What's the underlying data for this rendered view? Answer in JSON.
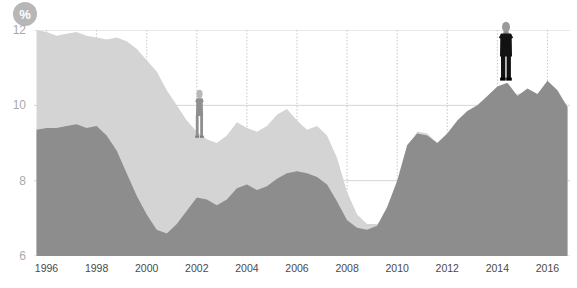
{
  "badge": {
    "icon": "percent-icon",
    "label": "%"
  },
  "chart_data": {
    "type": "area",
    "title": "",
    "subtitle": "",
    "xlabel": "",
    "ylabel": "%",
    "unit": "%",
    "grid": "vertical dotted at each labelled year; faint horizontal at each y tick",
    "legend_position": "none",
    "xlim": [
      1995.5,
      2016.9
    ],
    "ylim": [
      6,
      12
    ],
    "yticks": [
      6,
      8,
      10,
      12
    ],
    "ytick_labels": [
      "6",
      "8",
      "10",
      "12"
    ],
    "xticks": [
      1996,
      1998,
      2000,
      2002,
      2004,
      2006,
      2008,
      2010,
      2012,
      2014,
      2016
    ],
    "xtick_labels": [
      "1996",
      "1998",
      "2000",
      "2002",
      "2004",
      "2006",
      "2008",
      "2010",
      "2012",
      "2014",
      "2016"
    ],
    "colors": {
      "series_light": "#d4d4d4",
      "series_dark": "#8d8d8d",
      "grid": "#bdbdbd",
      "axis_text": "#4a4a4a",
      "y_text": "#a9a9a9"
    },
    "x": [
      1995.6,
      1996.0,
      1996.4,
      1996.8,
      1997.2,
      1997.6,
      1998.0,
      1998.4,
      1998.8,
      1999.2,
      1999.6,
      2000.0,
      2000.4,
      2000.8,
      2001.2,
      2001.6,
      2002.0,
      2002.4,
      2002.8,
      2003.2,
      2003.6,
      2004.0,
      2004.4,
      2004.8,
      2005.2,
      2005.6,
      2006.0,
      2006.4,
      2006.8,
      2007.2,
      2007.6,
      2008.0,
      2008.4,
      2008.8,
      2009.2,
      2009.6,
      2010.0,
      2010.4,
      2010.8,
      2011.2,
      2011.6,
      2012.0,
      2012.4,
      2012.8,
      2013.2,
      2013.6,
      2014.0,
      2014.4,
      2014.8,
      2015.2,
      2015.6,
      2016.0,
      2016.4,
      2016.8
    ],
    "series": [
      {
        "name": "light-area",
        "color": "#d4d4d4",
        "values": [
          12.0,
          11.95,
          11.85,
          11.9,
          11.95,
          11.85,
          11.8,
          11.75,
          11.8,
          11.7,
          11.5,
          11.2,
          10.9,
          10.4,
          10.0,
          9.6,
          9.3,
          9.1,
          9.0,
          9.2,
          9.55,
          9.4,
          9.3,
          9.45,
          9.75,
          9.9,
          9.6,
          9.35,
          9.45,
          9.2,
          8.6,
          7.7,
          7.1,
          6.85,
          6.85,
          7.1,
          7.6,
          8.9,
          9.3,
          9.25,
          9.0,
          9.2,
          9.55,
          9.8,
          9.95,
          10.15,
          10.35,
          10.4,
          10.3,
          10.35,
          10.3,
          10.55,
          10.3,
          10.0
        ]
      },
      {
        "name": "dark-area",
        "color": "#8d8d8d",
        "values": [
          9.35,
          9.4,
          9.4,
          9.45,
          9.5,
          9.4,
          9.45,
          9.2,
          8.8,
          8.2,
          7.6,
          7.1,
          6.7,
          6.6,
          6.85,
          7.2,
          7.55,
          7.5,
          7.35,
          7.5,
          7.8,
          7.9,
          7.75,
          7.85,
          8.05,
          8.2,
          8.25,
          8.2,
          8.1,
          7.9,
          7.45,
          6.95,
          6.75,
          6.7,
          6.8,
          7.3,
          8.0,
          8.95,
          9.25,
          9.2,
          9.0,
          9.25,
          9.6,
          9.85,
          10.0,
          10.25,
          10.5,
          10.6,
          10.25,
          10.45,
          10.3,
          10.65,
          10.4,
          9.95
        ]
      }
    ],
    "annotations": [
      {
        "name": "woman-figure",
        "x": 2002.1,
        "y": 9.05,
        "style": "grey standing woman pictogram"
      },
      {
        "name": "man-figure",
        "x": 2014.35,
        "y": 10.6,
        "style": "black standing man pictogram"
      }
    ]
  }
}
